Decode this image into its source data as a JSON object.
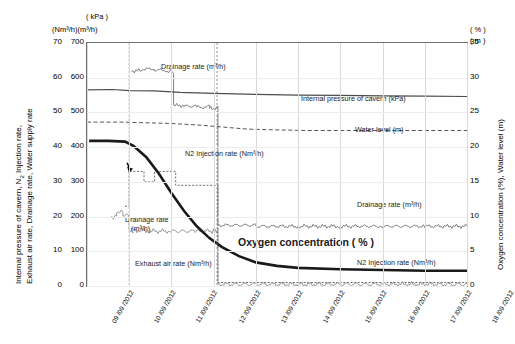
{
  "axes": {
    "left_unit_top": "( kPa )",
    "left_unit_top2": "(Nm³/h)(m³/h)",
    "left_title": "Internal pressure of cavern, N₂ Injection rate,\nExhaust air rate, Drainage rate, Water supply rate",
    "left_title_line1": "Internal pressure of cavern, N",
    "left_title_sub": "2",
    "left_title_line1b": " Injection rate,",
    "left_title_line2": "Exhaust air rate, Drainage rate, Water supply rate",
    "right_unit_top": "( % )",
    "right_unit_top2": "( m )",
    "right_title": "Oxygen concentration (%), Water level (m)",
    "left_ticks_kpa": [
      "70",
      "60",
      "50",
      "40",
      "30",
      "20",
      "10",
      "0"
    ],
    "left_ticks_flow": [
      "700",
      "600",
      "500",
      "400",
      "300",
      "200",
      "100",
      "0"
    ],
    "right_ticks": [
      "35",
      "30",
      "25",
      "20",
      "15",
      "10",
      "5",
      "0"
    ],
    "x_ticks": [
      "09 /09 /2012",
      "10 /09 /2012",
      "11 /09 /2012",
      "12 /09 /2012",
      "13 /09 /2012",
      "14 /09 /2012",
      "15 /09 /2012",
      "16 /09 /2012",
      "17 /09 /2012",
      "18 /09 /2012"
    ]
  },
  "labels": {
    "drainage_top": "Drainage rate (m³/h)",
    "internal_pressure": "Internal pressure of cavern (kPa)",
    "water_level": "Water level (m)",
    "n2_injection_mid": "N2 Injection rate (Nm³/h)",
    "drainage_right": "Drainage rate (m³/h)",
    "drainage_left_1": "Drainage rate",
    "drainage_left_2": "(m³/h)",
    "oxygen": "Oxygen concentration ( % )",
    "exhaust": "Exhaust air rate (Nm³/h)",
    "n2_injection_bottom": "N2 Injection rate (Nm³/h)"
  },
  "chart_data": {
    "type": "line",
    "title": "",
    "xlabel": "",
    "ylabel": "Internal pressure of cavern, N2 Injection rate, Exhaust air rate, Drainage rate, Water supply rate",
    "ylabel_right": "Oxygen concentration (%), Water level (m)",
    "grid": true,
    "legend": "inline-annotations",
    "x_range": [
      "09/09/2012",
      "18/09/2012"
    ],
    "ylim_left_kpa": [
      0,
      70
    ],
    "ylim_left_flow": [
      0,
      700
    ],
    "ylim_right": [
      0,
      35
    ],
    "series": [
      {
        "name": "Internal pressure of cavern (kPa)",
        "unit": "kPa",
        "style": "solid-thin",
        "color": "#4d4d4d",
        "points": [
          [
            0.0,
            56.5
          ],
          [
            0.6,
            56.6
          ],
          [
            1.0,
            56.3
          ],
          [
            1.6,
            56.2
          ],
          [
            2.2,
            55.8
          ],
          [
            3.0,
            55.5
          ],
          [
            4.0,
            55.2
          ],
          [
            5.0,
            55.0
          ],
          [
            6.0,
            54.9
          ],
          [
            7.0,
            54.8
          ],
          [
            8.0,
            54.7
          ],
          [
            9.0,
            54.6
          ]
        ]
      },
      {
        "name": "Water level (m)",
        "unit": "m",
        "style": "dashed",
        "color": "#555555",
        "points": [
          [
            0.0,
            23.6
          ],
          [
            0.8,
            23.6
          ],
          [
            1.4,
            23.5
          ],
          [
            2.0,
            23.4
          ],
          [
            2.6,
            23.2
          ],
          [
            3.2,
            22.9
          ],
          [
            3.8,
            22.6
          ],
          [
            4.4,
            22.5
          ],
          [
            5.2,
            22.4
          ],
          [
            6.0,
            22.4
          ],
          [
            7.0,
            22.4
          ],
          [
            8.0,
            22.4
          ],
          [
            9.0,
            22.4
          ]
        ]
      },
      {
        "name": "Oxygen concentration (%)",
        "unit": "%",
        "style": "solid-thick",
        "color": "#1a1a1a",
        "points": [
          [
            0.05,
            20.9
          ],
          [
            0.5,
            20.9
          ],
          [
            0.9,
            20.8
          ],
          [
            1.1,
            20.2
          ],
          [
            1.4,
            18.6
          ],
          [
            1.7,
            16.2
          ],
          [
            2.0,
            13.4
          ],
          [
            2.3,
            10.8
          ],
          [
            2.6,
            8.6
          ],
          [
            2.9,
            6.9
          ],
          [
            3.2,
            5.6
          ],
          [
            3.6,
            4.3
          ],
          [
            4.0,
            3.4
          ],
          [
            4.5,
            2.9
          ],
          [
            5.0,
            2.6
          ],
          [
            6.0,
            2.4
          ],
          [
            7.0,
            2.3
          ],
          [
            8.0,
            2.2
          ],
          [
            9.0,
            2.2
          ]
        ]
      },
      {
        "name": "Drainage rate (m³/h) - upper trace",
        "unit": "m³/h",
        "style": "noisy-step",
        "color": "#808080",
        "points": [
          [
            1.05,
            620
          ],
          [
            1.3,
            625
          ],
          [
            1.6,
            622
          ],
          [
            1.9,
            618
          ],
          [
            2.05,
            520
          ],
          [
            2.3,
            518
          ],
          [
            2.6,
            515
          ],
          [
            2.9,
            512
          ],
          [
            3.1,
            175
          ],
          [
            4.0,
            172
          ],
          [
            5.0,
            172
          ],
          [
            6.0,
            172
          ],
          [
            7.0,
            172
          ],
          [
            8.0,
            172
          ],
          [
            9.0,
            172
          ]
        ]
      },
      {
        "name": "N2 Injection rate (Nm³/h)",
        "unit": "Nm³/h",
        "style": "step",
        "color": "#6b6b6b",
        "points": [
          [
            0.9,
            230
          ],
          [
            1.0,
            330
          ],
          [
            1.25,
            330
          ],
          [
            1.35,
            300
          ],
          [
            1.5,
            300
          ],
          [
            1.6,
            330
          ],
          [
            2.0,
            330
          ],
          [
            2.1,
            290
          ],
          [
            2.6,
            290
          ],
          [
            3.0,
            290
          ],
          [
            3.1,
            10
          ],
          [
            4.0,
            10
          ],
          [
            9.0,
            10
          ]
        ]
      },
      {
        "name": "Exhaust air rate (Nm³/h)",
        "unit": "Nm³/h",
        "style": "noisy",
        "color": "#9a9a9a",
        "points": [
          [
            0.55,
            200
          ],
          [
            0.7,
            215
          ],
          [
            0.85,
            205
          ],
          [
            1.0,
            160
          ],
          [
            1.5,
            158
          ],
          [
            2.0,
            158
          ],
          [
            2.6,
            158
          ],
          [
            3.0,
            158
          ],
          [
            3.1,
            5
          ],
          [
            9.0,
            5
          ]
        ]
      }
    ],
    "annotations": [
      {
        "text": "Drainage rate (m³/h)",
        "x": 1.25,
        "y": 640
      },
      {
        "text": "Internal pressure of cavern (kPa)",
        "x": 4.6,
        "y": 57
      },
      {
        "text": "Water level (m)",
        "x": 6.3,
        "y": 23.5
      },
      {
        "text": "N2 Injection rate (Nm³/h)",
        "x": 1.25,
        "y": 400
      },
      {
        "text": "Drainage rate (m³/h)",
        "x": 6.2,
        "y": 200
      },
      {
        "text": "Drainage rate (m³/h)",
        "x": 0.75,
        "y": 135
      },
      {
        "text": "Oxygen concentration ( % )",
        "x": 4.0,
        "y": 95
      },
      {
        "text": "Exhaust air rate (Nm³/h)",
        "x": 0.9,
        "y": 40
      },
      {
        "text": "N2 Injection rate (Nm³/h)",
        "x": 6.2,
        "y": 35
      }
    ]
  }
}
